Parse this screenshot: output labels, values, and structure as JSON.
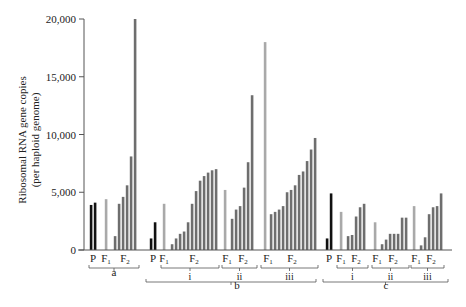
{
  "chart_data": {
    "type": "bar",
    "title": "",
    "xlabel": "",
    "ylabel": "Ribosomal RNA gene copies (per haploid genome)",
    "ylabel_lines": [
      "Ribosomal RNA gene copies",
      "(per haploid genome)"
    ],
    "ylim": [
      0,
      20000
    ],
    "yticks": [
      0,
      5000,
      10000,
      15000,
      20000
    ],
    "ytick_labels": [
      "0",
      "5,000",
      "10,000",
      "15,000",
      "20,000"
    ],
    "grid": false,
    "legend": null,
    "colors": {
      "P": "#111111",
      "F1": "#a9a9a9",
      "F2": "#6e6e6e",
      "axis": "#555555"
    },
    "groups": [
      {
        "name": "a",
        "subgroups": [
          {
            "name": "",
            "P": [
              3900,
              4100
            ],
            "F1": [
              4400
            ],
            "F2": [
              1200,
              4000,
              4600,
              5600,
              8100,
              20000
            ]
          }
        ]
      },
      {
        "name": "b",
        "P": [
          1000,
          2400
        ],
        "subgroups": [
          {
            "name": "i",
            "F1": [
              4000
            ],
            "F2": [
              500,
              1000,
              1400,
              1600,
              2400,
              4000,
              5100,
              6000,
              6400,
              6700,
              6900,
              7000
            ]
          },
          {
            "name": "ii",
            "F1": [
              5200
            ],
            "F2": [
              2700,
              3500,
              3800,
              5400,
              7600,
              13400
            ]
          },
          {
            "name": "iii",
            "F1": [
              18000
            ],
            "F2": [
              3100,
              3300,
              3500,
              3800,
              5000,
              5200,
              5600,
              6500,
              6800,
              7700,
              8700,
              9700
            ]
          }
        ]
      },
      {
        "name": "c",
        "P": [
          1000,
          4900
        ],
        "subgroups": [
          {
            "name": "i",
            "F1": [
              3300
            ],
            "F2": [
              1200,
              1300,
              2900,
              3700,
              4000
            ]
          },
          {
            "name": "ii",
            "F1": [
              2400
            ],
            "F2": [
              500,
              900,
              1400,
              1400,
              1400,
              2800,
              2800
            ]
          },
          {
            "name": "iii",
            "F1": [
              3800
            ],
            "F2": [
              400,
              1100,
              3100,
              3700,
              3800,
              4900
            ]
          }
        ]
      }
    ],
    "bars": [
      {
        "group": "a",
        "sub": "",
        "gen": "P",
        "x": 91,
        "value": 3900
      },
      {
        "group": "a",
        "sub": "",
        "gen": "P",
        "x": 95,
        "value": 4100
      },
      {
        "group": "a",
        "sub": "",
        "gen": "F1",
        "x": 106,
        "value": 4400
      },
      {
        "group": "a",
        "sub": "",
        "gen": "F2",
        "x": 115,
        "value": 1200
      },
      {
        "group": "a",
        "sub": "",
        "gen": "F2",
        "x": 119,
        "value": 4000
      },
      {
        "group": "a",
        "sub": "",
        "gen": "F2",
        "x": 123,
        "value": 4600
      },
      {
        "group": "a",
        "sub": "",
        "gen": "F2",
        "x": 127,
        "value": 5600
      },
      {
        "group": "a",
        "sub": "",
        "gen": "F2",
        "x": 131,
        "value": 8100
      },
      {
        "group": "a",
        "sub": "",
        "gen": "F2",
        "x": 135,
        "value": 20000
      },
      {
        "group": "b",
        "sub": "",
        "gen": "P",
        "x": 151,
        "value": 1000
      },
      {
        "group": "b",
        "sub": "",
        "gen": "P",
        "x": 155,
        "value": 2400
      },
      {
        "group": "b",
        "sub": "i",
        "gen": "F1",
        "x": 164,
        "value": 4000
      },
      {
        "group": "b",
        "sub": "i",
        "gen": "F2",
        "x": 172,
        "value": 500
      },
      {
        "group": "b",
        "sub": "i",
        "gen": "F2",
        "x": 176,
        "value": 1000
      },
      {
        "group": "b",
        "sub": "i",
        "gen": "F2",
        "x": 180,
        "value": 1400
      },
      {
        "group": "b",
        "sub": "i",
        "gen": "F2",
        "x": 184,
        "value": 1600
      },
      {
        "group": "b",
        "sub": "i",
        "gen": "F2",
        "x": 188,
        "value": 2400
      },
      {
        "group": "b",
        "sub": "i",
        "gen": "F2",
        "x": 192,
        "value": 4000
      },
      {
        "group": "b",
        "sub": "i",
        "gen": "F2",
        "x": 196,
        "value": 5100
      },
      {
        "group": "b",
        "sub": "i",
        "gen": "F2",
        "x": 200,
        "value": 6000
      },
      {
        "group": "b",
        "sub": "i",
        "gen": "F2",
        "x": 204,
        "value": 6400
      },
      {
        "group": "b",
        "sub": "i",
        "gen": "F2",
        "x": 208,
        "value": 6700
      },
      {
        "group": "b",
        "sub": "i",
        "gen": "F2",
        "x": 212,
        "value": 6900
      },
      {
        "group": "b",
        "sub": "i",
        "gen": "F2",
        "x": 216,
        "value": 7000
      },
      {
        "group": "b",
        "sub": "ii",
        "gen": "F1",
        "x": 225,
        "value": 5200
      },
      {
        "group": "b",
        "sub": "ii",
        "gen": "F2",
        "x": 232,
        "value": 2700
      },
      {
        "group": "b",
        "sub": "ii",
        "gen": "F2",
        "x": 236,
        "value": 3500
      },
      {
        "group": "b",
        "sub": "ii",
        "gen": "F2",
        "x": 240,
        "value": 3800
      },
      {
        "group": "b",
        "sub": "ii",
        "gen": "F2",
        "x": 244,
        "value": 5400
      },
      {
        "group": "b",
        "sub": "ii",
        "gen": "F2",
        "x": 248,
        "value": 7600
      },
      {
        "group": "b",
        "sub": "ii",
        "gen": "F2",
        "x": 252,
        "value": 13400
      },
      {
        "group": "b",
        "sub": "iii",
        "gen": "F1",
        "x": 265,
        "value": 18000
      },
      {
        "group": "b",
        "sub": "iii",
        "gen": "F2",
        "x": 271,
        "value": 3100
      },
      {
        "group": "b",
        "sub": "iii",
        "gen": "F2",
        "x": 275,
        "value": 3300
      },
      {
        "group": "b",
        "sub": "iii",
        "gen": "F2",
        "x": 279,
        "value": 3500
      },
      {
        "group": "b",
        "sub": "iii",
        "gen": "F2",
        "x": 283,
        "value": 3800
      },
      {
        "group": "b",
        "sub": "iii",
        "gen": "F2",
        "x": 287,
        "value": 5000
      },
      {
        "group": "b",
        "sub": "iii",
        "gen": "F2",
        "x": 291,
        "value": 5200
      },
      {
        "group": "b",
        "sub": "iii",
        "gen": "F2",
        "x": 295,
        "value": 5600
      },
      {
        "group": "b",
        "sub": "iii",
        "gen": "F2",
        "x": 299,
        "value": 6500
      },
      {
        "group": "b",
        "sub": "iii",
        "gen": "F2",
        "x": 303,
        "value": 6800
      },
      {
        "group": "b",
        "sub": "iii",
        "gen": "F2",
        "x": 307,
        "value": 7700
      },
      {
        "group": "b",
        "sub": "iii",
        "gen": "F2",
        "x": 311,
        "value": 8700
      },
      {
        "group": "b",
        "sub": "iii",
        "gen": "F2",
        "x": 315,
        "value": 9700
      },
      {
        "group": "c",
        "sub": "",
        "gen": "P",
        "x": 327,
        "value": 1000
      },
      {
        "group": "c",
        "sub": "",
        "gen": "P",
        "x": 331,
        "value": 4900
      },
      {
        "group": "c",
        "sub": "i",
        "gen": "F1",
        "x": 341,
        "value": 3300
      },
      {
        "group": "c",
        "sub": "i",
        "gen": "F2",
        "x": 348,
        "value": 1200
      },
      {
        "group": "c",
        "sub": "i",
        "gen": "F2",
        "x": 352,
        "value": 1300
      },
      {
        "group": "c",
        "sub": "i",
        "gen": "F2",
        "x": 356,
        "value": 2900
      },
      {
        "group": "c",
        "sub": "i",
        "gen": "F2",
        "x": 360,
        "value": 3700
      },
      {
        "group": "c",
        "sub": "i",
        "gen": "F2",
        "x": 364,
        "value": 4000
      },
      {
        "group": "c",
        "sub": "ii",
        "gen": "F1",
        "x": 375,
        "value": 2400
      },
      {
        "group": "c",
        "sub": "ii",
        "gen": "F2",
        "x": 382,
        "value": 500
      },
      {
        "group": "c",
        "sub": "ii",
        "gen": "F2",
        "x": 386,
        "value": 900
      },
      {
        "group": "c",
        "sub": "ii",
        "gen": "F2",
        "x": 390,
        "value": 1400
      },
      {
        "group": "c",
        "sub": "ii",
        "gen": "F2",
        "x": 394,
        "value": 1400
      },
      {
        "group": "c",
        "sub": "ii",
        "gen": "F2",
        "x": 398,
        "value": 1400
      },
      {
        "group": "c",
        "sub": "ii",
        "gen": "F2",
        "x": 402,
        "value": 2800
      },
      {
        "group": "c",
        "sub": "ii",
        "gen": "F2",
        "x": 406,
        "value": 2800
      },
      {
        "group": "c",
        "sub": "iii",
        "gen": "F1",
        "x": 414,
        "value": 3800
      },
      {
        "group": "c",
        "sub": "iii",
        "gen": "F2",
        "x": 421,
        "value": 400
      },
      {
        "group": "c",
        "sub": "iii",
        "gen": "F2",
        "x": 425,
        "value": 1100
      },
      {
        "group": "c",
        "sub": "iii",
        "gen": "F2",
        "x": 429,
        "value": 3100
      },
      {
        "group": "c",
        "sub": "iii",
        "gen": "F2",
        "x": 433,
        "value": 3700
      },
      {
        "group": "c",
        "sub": "iii",
        "gen": "F2",
        "x": 437,
        "value": 3800
      },
      {
        "group": "c",
        "sub": "iii",
        "gen": "F2",
        "x": 441,
        "value": 4900
      }
    ],
    "gen_labels": [
      {
        "text": "P",
        "sub": "",
        "x": 93
      },
      {
        "text": "F",
        "sub": "1",
        "x": 106
      },
      {
        "text": "F",
        "sub": "2",
        "x": 125
      },
      {
        "text": "P",
        "sub": "",
        "x": 153
      },
      {
        "text": "F",
        "sub": "1",
        "x": 164
      },
      {
        "text": "F",
        "sub": "2",
        "x": 194
      },
      {
        "text": "F",
        "sub": "1",
        "x": 227
      },
      {
        "text": "F",
        "sub": "2",
        "x": 243
      },
      {
        "text": "F",
        "sub": "1",
        "x": 268
      },
      {
        "text": "F",
        "sub": "2",
        "x": 292
      },
      {
        "text": "P",
        "sub": "",
        "x": 329
      },
      {
        "text": "F",
        "sub": "1",
        "x": 341
      },
      {
        "text": "F",
        "sub": "2",
        "x": 356
      },
      {
        "text": "F",
        "sub": "1",
        "x": 377
      },
      {
        "text": "F",
        "sub": "2",
        "x": 393
      },
      {
        "text": "F",
        "sub": "1",
        "x": 416
      },
      {
        "text": "F",
        "sub": "2",
        "x": 431
      }
    ],
    "sub_brackets": [
      {
        "label": "",
        "x1": 89,
        "x2": 139,
        "level": 1
      },
      {
        "label": "i",
        "x1": 161,
        "x2": 219,
        "level": 1
      },
      {
        "label": "ii",
        "x1": 222,
        "x2": 257,
        "level": 1
      },
      {
        "label": "iii",
        "x1": 261,
        "x2": 318,
        "level": 1
      },
      {
        "label": "i",
        "x1": 337,
        "x2": 368,
        "level": 1
      },
      {
        "label": "ii",
        "x1": 372,
        "x2": 409,
        "level": 1
      },
      {
        "label": "iii",
        "x1": 411,
        "x2": 444,
        "level": 1
      }
    ],
    "group_labels": [
      {
        "label": "a",
        "x": 114,
        "y": 276
      },
      {
        "label": "b",
        "x": 237,
        "y": 289
      },
      {
        "label": "c",
        "x": 386,
        "y": 289
      }
    ],
    "group_brackets": [
      {
        "label": "b",
        "x1": 146,
        "x2": 316
      },
      {
        "label": "c",
        "x1": 323,
        "x2": 448
      }
    ]
  }
}
